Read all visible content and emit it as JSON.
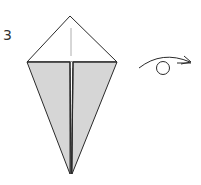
{
  "step": {
    "number": "3"
  },
  "diagram": {
    "type": "origami-fold-step",
    "model_shape": "kite",
    "colors": {
      "line": "#2a2a2a",
      "fold_line": "#9a9a9a",
      "shaded_fill": "#d6d6d6",
      "paper_fill": "#ffffff"
    },
    "symbols": [
      {
        "name": "turn-over",
        "meaning": "turn the model over"
      }
    ]
  }
}
